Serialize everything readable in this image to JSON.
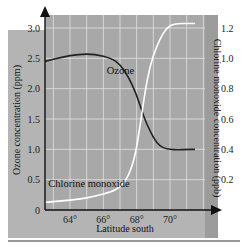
{
  "header": {
    "partial_title": ""
  },
  "chart_data": {
    "type": "line",
    "title": "",
    "xlabel": "Latitude south",
    "ylabel_left": "Ozone concentration (ppm)",
    "ylabel_right": "Chlorine monoxide concentration (ppb)",
    "xlim": [
      62.5,
      72.1
    ],
    "ylim_left": [
      0,
      3.0
    ],
    "ylim_right": [
      0,
      1.2
    ],
    "x_ticks": [
      "64°",
      "66°",
      "68°",
      "70°"
    ],
    "x_tick_values": [
      64,
      66,
      68,
      70
    ],
    "y_left_ticks": [
      "0",
      "0.5",
      "1.0",
      "1.5",
      "2.0",
      "2.5",
      "3.0"
    ],
    "y_left_tick_values": [
      0,
      0.5,
      1.0,
      1.5,
      2.0,
      2.5,
      3.0
    ],
    "y_right_ticks": [
      "0.2",
      "0.4",
      "0.6",
      "0.8",
      "1.0",
      "1.2"
    ],
    "y_right_tick_values": [
      0.2,
      0.4,
      0.6,
      0.8,
      1.0,
      1.2
    ],
    "grid": true,
    "series": [
      {
        "name": "Ozone",
        "axis": "left",
        "color": "#222222",
        "x": [
          62.5,
          63.5,
          64.5,
          65.5,
          66.5,
          67.0,
          67.5,
          68.0,
          68.4,
          68.8,
          69.2,
          69.6,
          70.0,
          70.5,
          71.0,
          71.5
        ],
        "values": [
          2.45,
          2.52,
          2.57,
          2.57,
          2.5,
          2.4,
          2.2,
          1.9,
          1.55,
          1.3,
          1.1,
          1.02,
          1.0,
          0.99,
          1.0,
          1.0
        ]
      },
      {
        "name": "Chlorine monoxide",
        "axis": "right",
        "color": "#ffffff",
        "x": [
          62.5,
          63.5,
          64.5,
          65.5,
          66.5,
          67.0,
          67.5,
          67.9,
          68.2,
          68.5,
          68.8,
          69.2,
          69.6,
          70.0,
          70.5,
          71.0,
          71.5
        ],
        "values": [
          0.05,
          0.06,
          0.07,
          0.09,
          0.12,
          0.15,
          0.22,
          0.35,
          0.55,
          0.78,
          0.95,
          1.08,
          1.17,
          1.22,
          1.23,
          1.23,
          1.23
        ]
      }
    ],
    "annotations": [
      {
        "text": "Ozone",
        "x": 66.2,
        "y_left": 2.3
      },
      {
        "text": "Chlorine monoxide",
        "x": 62.7,
        "y_left": 0.45
      }
    ]
  },
  "colors": {
    "plot_bg": "#a8a8a8",
    "outer_bg": "#b4b4b4",
    "grid": "#e2e2e2",
    "axis": "#111111"
  }
}
